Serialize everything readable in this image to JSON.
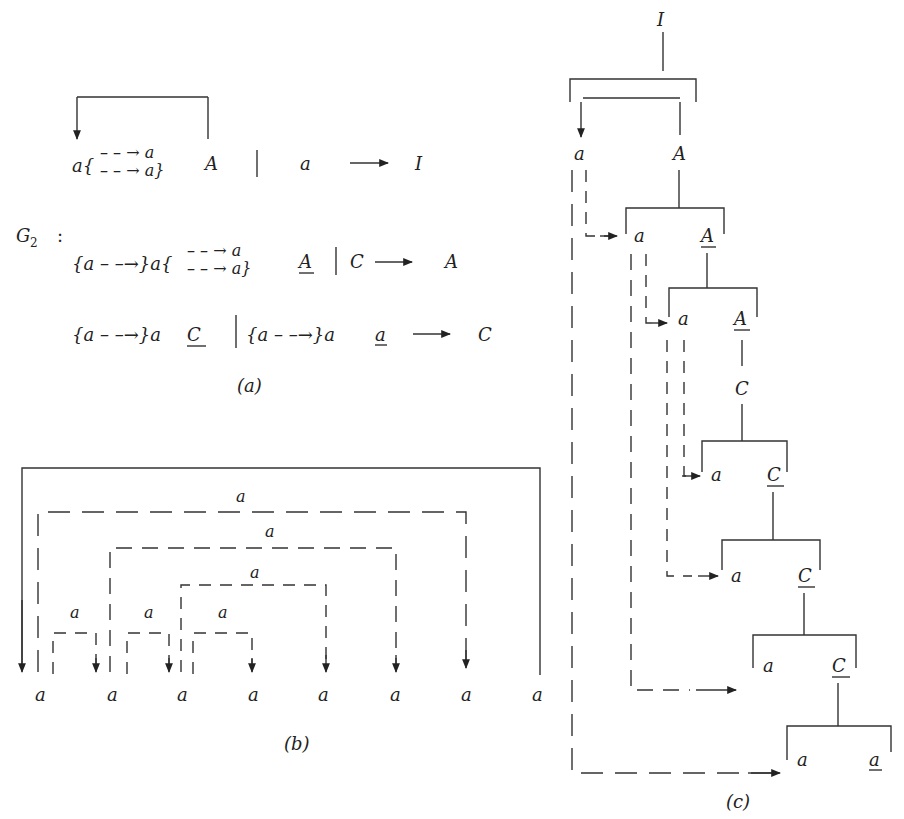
{
  "figure": {
    "panel_a": {
      "caption": "(a)",
      "grammar_label": "G",
      "grammar_subscript": "2",
      "grammar_colon": ":",
      "rules": [
        {
          "lhs": "I",
          "alt1_prefix": "a{",
          "alt1_stack_top": "– – → a",
          "alt1_stack_bottom": "– – → a}",
          "alt1_symbol": "A",
          "alt2": "a"
        },
        {
          "lhs": "A",
          "alt1_prefix": "{a – –→}a{",
          "alt1_stack_top": "– – → a",
          "alt1_stack_bottom": "– – → a}",
          "alt1_symbol": "A",
          "alt2": "C"
        },
        {
          "lhs": "C",
          "alt1_prefix": "{a – –→}a",
          "alt1_symbol": "C",
          "alt2_prefix": "{a – –→}a",
          "alt2_symbol": "a"
        }
      ],
      "separator": "|",
      "arrow": "⟶"
    },
    "panel_b": {
      "caption": "(b)",
      "bottom_symbols": [
        "a",
        "a",
        "a",
        "a",
        "a",
        "a",
        "a",
        "a"
      ],
      "edge_labels": [
        "a",
        "a",
        "a",
        "a",
        "a",
        "a"
      ]
    },
    "panel_c": {
      "caption": "(c)",
      "root": "I",
      "nodes": [
        {
          "left": "a",
          "right": "A"
        },
        {
          "left": "a",
          "right": "A",
          "right_underlined": true
        },
        {
          "left": "a",
          "right": "A",
          "right_underlined": true
        },
        {
          "single": "C"
        },
        {
          "left": "a",
          "right": "C",
          "right_underlined": true
        },
        {
          "left": "a",
          "right": "C",
          "right_underlined": true
        },
        {
          "left": "a",
          "right": "C",
          "right_underlined": true
        },
        {
          "left": "a",
          "right": "a",
          "right_underlined": true
        }
      ]
    }
  }
}
